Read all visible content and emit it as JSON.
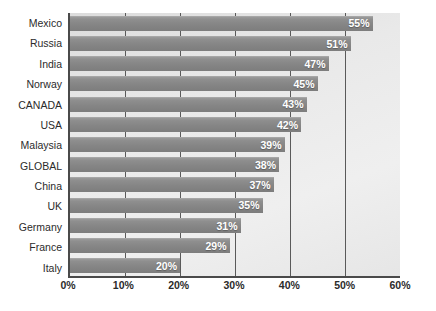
{
  "chart_data": {
    "type": "bar",
    "orientation": "horizontal",
    "title": "",
    "xlabel": "",
    "ylabel": "",
    "xlim": [
      0,
      60
    ],
    "xticks": [
      0,
      10,
      20,
      30,
      40,
      50,
      60
    ],
    "xtick_labels": [
      "0%",
      "10%",
      "20%",
      "30%",
      "40%",
      "50%",
      "60%"
    ],
    "grid": true,
    "legend": false,
    "value_suffix": "%",
    "categories": [
      "Mexico",
      "Russia",
      "India",
      "Norway",
      "CANADA",
      "USA",
      "Malaysia",
      "GLOBAL",
      "China",
      "UK",
      "Germany",
      "France",
      "Italy"
    ],
    "values": [
      55,
      51,
      47,
      45,
      43,
      42,
      39,
      38,
      37,
      35,
      31,
      29,
      20
    ],
    "value_labels": [
      "55%",
      "51%",
      "47%",
      "45%",
      "43%",
      "42%",
      "39%",
      "38%",
      "37%",
      "35%",
      "31%",
      "29%",
      "20%"
    ],
    "colors": {
      "bar": "#8a8a8a",
      "bar_label": "#ffffff",
      "plot_background": "#e8e8e8",
      "gridline": "#5a5a5a",
      "axis_line": "#4a4a4a",
      "text": "#2b2b2b",
      "page_background": "#ffffff"
    }
  }
}
